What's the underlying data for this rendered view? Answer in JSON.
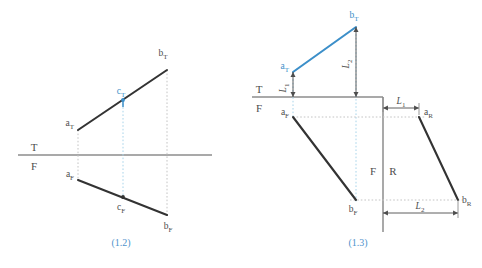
{
  "figure_1": {
    "caption": "(1.2)",
    "fold_line": {
      "upper_label": "T",
      "lower_label": "F"
    },
    "points": [
      {
        "name": "a_T",
        "base": "a",
        "sub": "T",
        "x": 78,
        "y": 130,
        "color": "#333333"
      },
      {
        "name": "b_T",
        "base": "b",
        "sub": "T",
        "x": 167,
        "y": 70,
        "color": "#333333"
      },
      {
        "name": "c_T",
        "base": "c",
        "sub": "T",
        "x": 123,
        "y": 100,
        "color": "#3c8fc9"
      },
      {
        "name": "a_F",
        "base": "a",
        "sub": "F",
        "x": 78,
        "y": 180,
        "color": "#333333"
      },
      {
        "name": "b_F",
        "base": "b",
        "sub": "F",
        "x": 167,
        "y": 215,
        "color": "#333333"
      },
      {
        "name": "c_F",
        "base": "c",
        "sub": "F",
        "x": 123,
        "y": 197,
        "color": "#333333"
      }
    ]
  },
  "figure_2": {
    "caption": "(1.3)",
    "fold_line_tf": {
      "upper_label": "T",
      "lower_label": "F"
    },
    "fold_line_fr": {
      "left_label": "F",
      "right_label": "R"
    },
    "points": [
      {
        "name": "a_T",
        "base": "a",
        "sub": "T",
        "x": 293,
        "y": 72,
        "color": "#3c8fc9"
      },
      {
        "name": "b_T",
        "base": "b",
        "sub": "T",
        "x": 356,
        "y": 27,
        "color": "#3c8fc9"
      },
      {
        "name": "a_F",
        "base": "a",
        "sub": "F",
        "x": 293,
        "y": 117,
        "color": "#333333"
      },
      {
        "name": "b_F",
        "base": "b",
        "sub": "F",
        "x": 356,
        "y": 200,
        "color": "#333333"
      },
      {
        "name": "a_R",
        "base": "a",
        "sub": "R",
        "x": 419,
        "y": 117,
        "color": "#333333"
      },
      {
        "name": "b_R",
        "base": "b",
        "sub": "R",
        "x": 458,
        "y": 200,
        "color": "#333333"
      }
    ],
    "dimensions": [
      {
        "name": "L_1_vertical",
        "base": "L",
        "sub": "1",
        "orientation": "vertical"
      },
      {
        "name": "L_2_vertical",
        "base": "L",
        "sub": "2",
        "orientation": "vertical"
      },
      {
        "name": "L_1_horizontal",
        "base": "L",
        "sub": "1",
        "orientation": "horizontal"
      },
      {
        "name": "L_2_horizontal",
        "base": "L",
        "sub": "2",
        "orientation": "horizontal"
      }
    ]
  },
  "colors": {
    "line_dark": "#333333",
    "line_blue": "#3c8fc9",
    "fold_gray": "#8c8c8c",
    "projector_gray": "#bfbfbf",
    "projector_blue": "#add8ea",
    "caption_blue": "#4f93cc"
  }
}
